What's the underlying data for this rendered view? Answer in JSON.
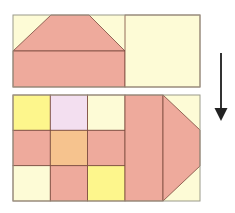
{
  "diagram": {
    "colors": {
      "cream": "#fdfbd6",
      "salmon": "#eeaa9c",
      "yellow": "#fdf68c",
      "lavender": "#f3dff0",
      "peach": "#f6c38e",
      "line": "#7a4a3e",
      "outline": "#9a9a8a",
      "arrow": "#333333"
    },
    "top_unit": {
      "outer": {
        "x": 13,
        "y": 15,
        "w": 187,
        "h": 72
      },
      "roof_trapezoid": [
        [
          51,
          15
        ],
        [
          89,
          15
        ],
        [
          125,
          51
        ],
        [
          13,
          51
        ]
      ],
      "base_rect": {
        "x": 13,
        "y": 51,
        "w": 112,
        "h": 36
      },
      "plain_square": {
        "x": 125,
        "y": 15,
        "w": 75,
        "h": 72
      }
    },
    "bottom_unit": {
      "outer": {
        "x": 13,
        "y": 95,
        "w": 187,
        "h": 106
      },
      "nine_patch": [
        [
          "yellow",
          "lavender",
          "cream"
        ],
        [
          "salmon",
          "peach",
          "salmon"
        ],
        [
          "cream",
          "salmon",
          "yellow"
        ]
      ],
      "strip": {
        "x": 125,
        "y": 95,
        "w": 38,
        "h": 106,
        "color": "salmon"
      },
      "point": [
        [
          163,
          95
        ],
        [
          200,
          130
        ],
        [
          200,
          166
        ],
        [
          163,
          201
        ]
      ]
    },
    "arrow": {
      "x": 221,
      "y1": 53,
      "y2": 121,
      "direction": "down"
    }
  }
}
